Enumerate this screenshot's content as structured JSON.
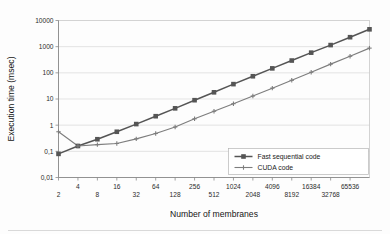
{
  "chart_data": {
    "type": "line",
    "title": "",
    "xlabel": "Number of membranes",
    "ylabel": "Execution time (msec)",
    "xscale": "log2",
    "yscale": "log10",
    "xlim": [
      2,
      131072
    ],
    "ylim": [
      0.01,
      10000
    ],
    "grid": true,
    "legend_position": "lower-right",
    "x": [
      2,
      4,
      8,
      16,
      32,
      64,
      128,
      256,
      512,
      1024,
      2048,
      4096,
      8192,
      16384,
      32768,
      65536,
      131072
    ],
    "xtick_labels_upper": [
      "4",
      "16",
      "64",
      "256",
      "1024",
      "4096",
      "16384",
      "65536"
    ],
    "xtick_labels_lower": [
      "2",
      "8",
      "32",
      "128",
      "512",
      "2048",
      "8192",
      "32768"
    ],
    "ytick_labels": [
      "10000",
      "1000",
      "100",
      "10",
      "1",
      "0,1",
      "0,01"
    ],
    "ytick_values": [
      10000,
      1000,
      100,
      10,
      1,
      0.1,
      0.01
    ],
    "series": [
      {
        "name": "Fast sequential code",
        "marker": "square",
        "color": "#555555",
        "values": [
          0.08,
          0.16,
          0.29,
          0.56,
          1.1,
          2.2,
          4.4,
          9.0,
          18,
          37,
          74,
          148,
          295,
          590,
          1150,
          2300,
          4600
        ]
      },
      {
        "name": "CUDA code",
        "marker": "plus",
        "color": "#7d7d7d",
        "values": [
          0.56,
          0.16,
          0.18,
          0.2,
          0.3,
          0.48,
          0.85,
          1.75,
          3.4,
          6.6,
          13,
          26,
          52,
          105,
          215,
          430,
          880
        ]
      }
    ]
  },
  "legend": {
    "entries": [
      {
        "label": "Fast sequential code",
        "marker": "square"
      },
      {
        "label": "CUDA code",
        "marker": "plus"
      }
    ]
  },
  "axes": {
    "y_title": "Execution time (msec)",
    "x_title": "Number of membranes"
  }
}
